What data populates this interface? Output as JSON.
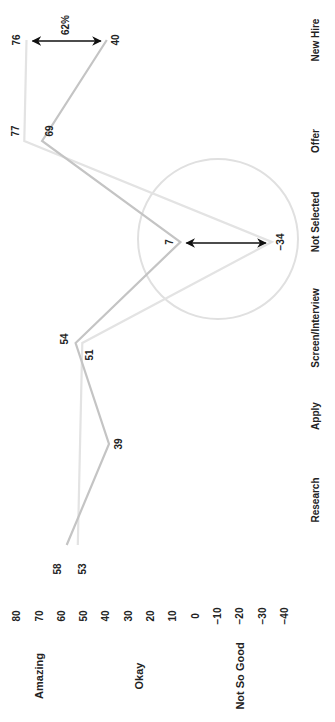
{
  "chart_data": {
    "type": "line",
    "orientation": "rotated-90-clockwise",
    "title": "",
    "xlabel": "",
    "ylabel": "",
    "categories": [
      "Research",
      "Apply",
      "Screen/Interview",
      "Not Selected",
      "Offer",
      "New Hire"
    ],
    "series": [
      {
        "name": "Series A",
        "color": "#c4c4c4",
        "values": [
          58,
          39,
          54,
          7,
          69,
          40
        ],
        "labels": [
          "58",
          "39",
          "54",
          "7",
          "69",
          "40"
        ]
      },
      {
        "name": "Series B",
        "color": "#e3e3e3",
        "values": [
          53,
          null,
          51,
          -34,
          77,
          76
        ],
        "labels": [
          "53",
          "",
          "51",
          "-34",
          "77",
          "76"
        ]
      }
    ],
    "ylim": [
      -40,
      80
    ],
    "yticks": [
      80,
      70,
      60,
      50,
      40,
      30,
      20,
      10,
      0,
      -10,
      -20,
      -30,
      -40
    ],
    "ytick_labels": [
      "80",
      "70",
      "60",
      "50",
      "40",
      "30",
      "20",
      "10",
      "0",
      "−10",
      "−20",
      "−30",
      "−40"
    ],
    "bands": [
      {
        "label": "Amazing",
        "value": 70
      },
      {
        "label": "Okay",
        "value": 25
      },
      {
        "label": "Not So Good",
        "value": -20
      }
    ],
    "annotations": [
      {
        "type": "double-arrow",
        "category": "New Hire",
        "from": 76,
        "to": 40,
        "label": "62%"
      },
      {
        "type": "double-arrow",
        "category": "Not Selected",
        "from": 7,
        "to": -34,
        "label": ""
      },
      {
        "type": "circle",
        "category": "Not Selected",
        "note": "highlight around Not Selected divergence"
      }
    ],
    "grid": false,
    "legend": "none"
  }
}
